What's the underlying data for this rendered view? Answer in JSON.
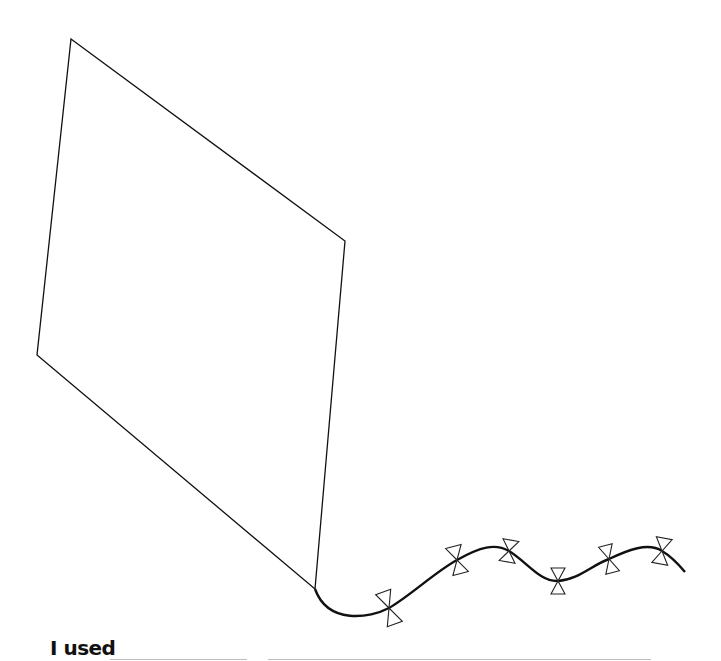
{
  "worksheet": {
    "prompt_label": "I used",
    "answer_blanks": [
      {
        "id": "blank-1",
        "value": ""
      },
      {
        "id": "blank-2",
        "value": ""
      }
    ]
  },
  "drawing": {
    "subject": "kite outline with tail and bows",
    "kite_vertices": [
      [
        71,
        39
      ],
      [
        345,
        241
      ],
      [
        315,
        589
      ],
      [
        37,
        355
      ]
    ],
    "bow_count": 6,
    "stroke_color": "#111111"
  }
}
